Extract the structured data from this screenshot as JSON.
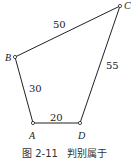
{
  "diagram": {
    "points": {
      "A": {
        "label": "A",
        "x": 33,
        "y": 123
      },
      "B": {
        "label": "B",
        "x": 15,
        "y": 57
      },
      "C": {
        "label": "C",
        "x": 120,
        "y": 6
      },
      "D": {
        "label": "D",
        "x": 80,
        "y": 123
      }
    },
    "edges": {
      "AB": {
        "length": "30"
      },
      "BC": {
        "length": "50"
      },
      "CD": {
        "length": "55"
      },
      "AD": {
        "length": "20"
      }
    },
    "caption": "图 2-11   判别属于",
    "line_color": "#222222"
  }
}
